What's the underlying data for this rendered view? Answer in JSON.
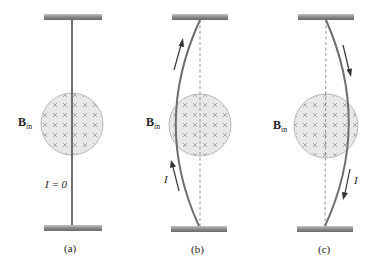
{
  "colors": {
    "bar_dark": "#6e6e6e",
    "bar_light": "#b8b8b8",
    "wire": "#707070",
    "field_fill": "#e8e8e8",
    "field_stroke": "#a8a8a8",
    "cross": "#9a9a9a",
    "dashed": "#888888",
    "arrow": "#333333"
  },
  "field_label": {
    "main": "B",
    "sub": "in"
  },
  "panels": [
    {
      "id": "a",
      "caption": "(a)",
      "current_label": "I = 0",
      "wire_shape": "straight",
      "arrow_direction": "none"
    },
    {
      "id": "b",
      "caption": "(b)",
      "current_label": "I",
      "wire_shape": "bowed-left",
      "arrow_direction": "up"
    },
    {
      "id": "c",
      "caption": "(c)",
      "current_label": "I",
      "wire_shape": "bowed-right",
      "arrow_direction": "down"
    }
  ]
}
